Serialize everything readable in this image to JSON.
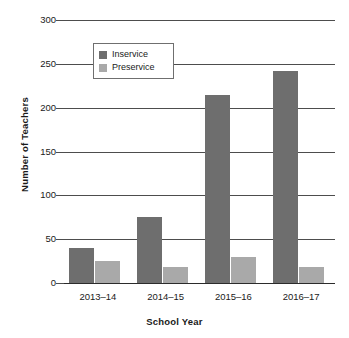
{
  "chart_data": {
    "type": "bar",
    "title": "",
    "xlabel": "School Year",
    "ylabel": "Number of Teachers",
    "categories": [
      "2013–14",
      "2014–15",
      "2015–16",
      "2016–17"
    ],
    "series": [
      {
        "name": "Inservice",
        "color": "#6e6e6e",
        "values": [
          40,
          75,
          215,
          242
        ]
      },
      {
        "name": "Preservice",
        "color": "#a9a9a9",
        "values": [
          25,
          18,
          30,
          18
        ]
      }
    ],
    "ylim": [
      0,
      300
    ],
    "yticks": [
      0,
      50,
      100,
      150,
      200,
      250,
      300
    ],
    "ytick_labels": [
      "0",
      "50",
      "100",
      "150",
      "200",
      "250",
      "300"
    ],
    "grid": true,
    "legend_position": "upper-left-inside"
  },
  "axes": {
    "y_title": "Number of Teachers",
    "x_title": "School Year"
  },
  "legend": {
    "items": [
      {
        "label": "Inservice",
        "swatch": "inservice-swatch"
      },
      {
        "label": "Preservice",
        "swatch": "preservice-swatch"
      }
    ]
  }
}
